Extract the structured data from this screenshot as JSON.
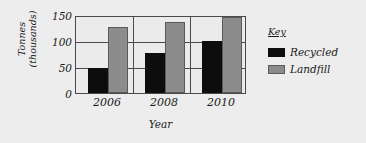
{
  "chart_data": {
    "type": "bar",
    "title": "",
    "xlabel": "Year",
    "ylabel": "Tonnes\n(thousands)",
    "categories": [
      "2006",
      "2008",
      "2010"
    ],
    "series": [
      {
        "name": "Recycled",
        "color": "#0d0d0d",
        "values": [
          50,
          78,
          102
        ]
      },
      {
        "name": "Landfill",
        "color": "#8c8c8c",
        "values": [
          130,
          140,
          150
        ]
      }
    ],
    "ylim": [
      0,
      150
    ],
    "yticks": [
      "0",
      "50",
      "100",
      "150"
    ],
    "ytick_values": [
      0,
      50,
      100,
      150
    ],
    "grid": true,
    "legend": {
      "title": "Key",
      "position": "right",
      "entries": [
        "Recycled",
        "Landfill"
      ]
    }
  }
}
